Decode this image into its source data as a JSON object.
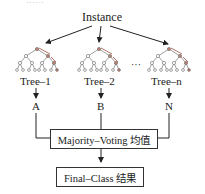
{
  "header_fragment": "……",
  "root": {
    "label": "Instance"
  },
  "trees": [
    {
      "label": "Tree–1",
      "output": "A"
    },
    {
      "label": "Tree–2",
      "output": "B"
    },
    {
      "label": "Tree–n",
      "output": "N"
    }
  ],
  "ellipsis": "···",
  "aggregator": {
    "label": "Majority–Voting 均值"
  },
  "result": {
    "label": "Final–Class 结果"
  },
  "colors": {
    "line": "#333333",
    "path_node": "#b07060",
    "node": "#888888"
  }
}
